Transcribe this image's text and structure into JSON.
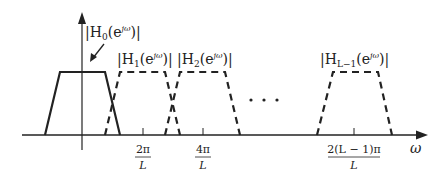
{
  "diagram": {
    "type": "filter-bank-frequency-response",
    "x_axis_label": "ω",
    "colors": {
      "line": "#222222",
      "background": "#ffffff"
    },
    "filters": [
      {
        "name": "H0",
        "label": "|H₀(e^{jω})|",
        "label_main": "|H",
        "label_sub": "0",
        "label_mid": "(e",
        "label_sup": "jω",
        "label_end": ")|",
        "style": "solid"
      },
      {
        "name": "H1",
        "label": "|H₁(e^{jω})|",
        "label_main": "|H",
        "label_sub": "1",
        "label_mid": "(e",
        "label_sup": "jω",
        "label_end": ")|",
        "style": "dashed"
      },
      {
        "name": "H2",
        "label": "|H₂(e^{jω})|",
        "label_main": "|H",
        "label_sub": "2",
        "label_mid": "(e",
        "label_sup": "jω",
        "label_end": ")|",
        "style": "dashed"
      },
      {
        "name": "HL-1",
        "label": "|H_{L−1}(e^{jω})|",
        "label_main": "|H",
        "label_sub": "L−1",
        "label_mid": "(e",
        "label_sup": "jω",
        "label_end": ")|",
        "style": "dashed"
      }
    ],
    "ellipsis": "· · ·",
    "ticks": [
      {
        "num": "2π",
        "den": "L"
      },
      {
        "num": "4π",
        "den": "L"
      },
      {
        "num": "2(L − 1)π",
        "den": "L"
      }
    ]
  }
}
